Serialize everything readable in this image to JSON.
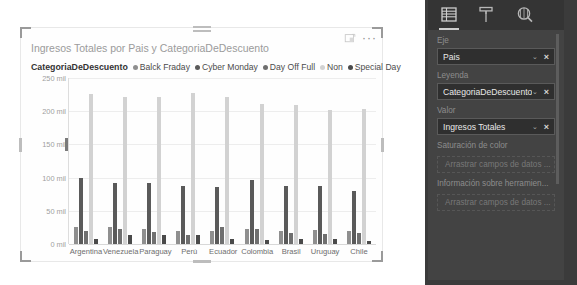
{
  "visual": {
    "title": "Ingresos Totales por Pais y CategoriaDeDescuento",
    "focus_icon": "focus-mode-icon",
    "more_icon": "more-options-icon",
    "more_label": "···"
  },
  "legend": {
    "title": "CategoriaDeDescuento",
    "items": [
      {
        "label": "Balck Fraday",
        "color": "#8f8f8f"
      },
      {
        "label": "Cyber Monday",
        "color": "#5a5a5a"
      },
      {
        "label": "Day Off Full",
        "color": "#6f6f6f"
      },
      {
        "label": "Non",
        "color": "#d2d2d2"
      },
      {
        "label": "Special Day",
        "color": "#4a4a4a"
      }
    ]
  },
  "chart_data": {
    "type": "bar",
    "title": "Ingresos Totales por Pais y CategoriaDeDescuento",
    "xlabel": "",
    "ylabel": "",
    "ylim": [
      0,
      250000
    ],
    "ytick_labels": [
      "0 mil",
      "50 mil",
      "100 mil",
      "150 mil",
      "200 mil",
      "250 mil"
    ],
    "ytick_values": [
      0,
      50000,
      100000,
      150000,
      200000,
      250000
    ],
    "grid": true,
    "legend_position": "top",
    "categories": [
      "Argentina",
      "Venezuela",
      "Paraguay",
      "Perú",
      "Ecuador",
      "Colombia",
      "Brasil",
      "Uruguay",
      "Chile"
    ],
    "series": [
      {
        "name": "Balck Fraday",
        "color": "#8f8f8f",
        "values": [
          26000,
          26000,
          22000,
          20000,
          20000,
          22000,
          20000,
          21000,
          20000
        ]
      },
      {
        "name": "Cyber Monday",
        "color": "#5a5a5a",
        "values": [
          100000,
          92000,
          92000,
          87000,
          86000,
          96000,
          87000,
          88000,
          80000
        ]
      },
      {
        "name": "Day Off Full",
        "color": "#6f6f6f",
        "values": [
          19000,
          22000,
          18000,
          14000,
          25000,
          22000,
          17000,
          15000,
          17000
        ]
      },
      {
        "name": "Non",
        "color": "#d2d2d2",
        "values": [
          226000,
          221000,
          221000,
          228000,
          222000,
          211000,
          210000,
          202000,
          204000
        ]
      },
      {
        "name": "Special Day",
        "color": "#4a4a4a",
        "values": [
          8000,
          14000,
          13000,
          13000,
          7000,
          6000,
          7000,
          7000,
          5000
        ]
      }
    ]
  },
  "fields_pane": {
    "tabs": [
      {
        "name": "fields-tab",
        "icon": "fields-list-icon",
        "active": true
      },
      {
        "name": "format-tab",
        "icon": "paint-roller-icon",
        "active": false
      },
      {
        "name": "analytics-tab",
        "icon": "magnifier-icon",
        "active": false
      }
    ],
    "wells": [
      {
        "label": "Eje",
        "field": "Pais",
        "chevron": "⌄",
        "remove": "×"
      },
      {
        "label": "Leyenda",
        "field": "CategoriaDeDescuento",
        "chevron": "⌄",
        "remove": "×"
      },
      {
        "label": "Valor",
        "field": "Ingresos Totales",
        "chevron": "⌄",
        "remove": "×"
      }
    ],
    "empty_wells": [
      {
        "label": "Saturación de color",
        "placeholder": "Arrastrar campos de datos ..."
      },
      {
        "label": "Información sobre herramien...",
        "placeholder": "Arrastrar campos de datos ..."
      }
    ]
  }
}
